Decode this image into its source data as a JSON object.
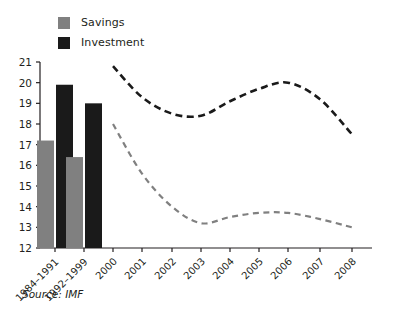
{
  "legend": {
    "items": [
      {
        "label": "Savings",
        "color": "#808080",
        "icon": "square-swatch-icon"
      },
      {
        "label": "Investment",
        "color": "#1a1a1a",
        "icon": "square-swatch-icon"
      }
    ]
  },
  "source": "Source: IMF",
  "chart_data": {
    "type": "bar",
    "title": "",
    "subtitle": "",
    "xlabel": "",
    "ylabel": "",
    "ylim": [
      12,
      21
    ],
    "ytick_labels": [
      "12",
      "13",
      "14",
      "15",
      "16",
      "17",
      "18",
      "19",
      "20",
      "21"
    ],
    "grid": false,
    "legend_position": "top-left",
    "categories": [
      "1984–1991",
      "1992–1999",
      "2000",
      "2001",
      "2002",
      "2003",
      "2004",
      "2005",
      "2006",
      "2007",
      "2008"
    ],
    "bar_categories": [
      "1984–1991",
      "1992–1999"
    ],
    "line_categories": [
      "2000",
      "2001",
      "2002",
      "2003",
      "2004",
      "2005",
      "2006",
      "2007",
      "2008"
    ],
    "series": [
      {
        "name": "Savings",
        "color": "#808080",
        "style": "bars-then-dashed-line",
        "bar_values": [
          17.2,
          16.4
        ],
        "line_values": [
          18.0,
          15.6,
          14.0,
          13.2,
          13.5,
          13.7,
          13.7,
          13.4,
          13.0
        ]
      },
      {
        "name": "Investment",
        "color": "#1a1a1a",
        "style": "bars-then-dashed-line",
        "bar_values": [
          19.9,
          19.0
        ],
        "line_values": [
          20.8,
          19.3,
          18.5,
          18.4,
          19.1,
          19.7,
          20.0,
          19.2,
          17.5
        ]
      }
    ]
  }
}
